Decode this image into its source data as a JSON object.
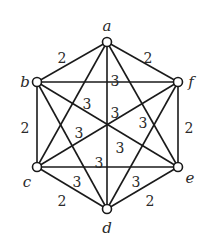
{
  "diagram": {
    "type": "weighted-graph",
    "nodes": [
      {
        "id": "a",
        "label": "a",
        "x": 107,
        "y": 42,
        "lx": 107,
        "ly": 26
      },
      {
        "id": "b",
        "label": "b",
        "x": 37,
        "y": 82,
        "lx": 25,
        "ly": 82
      },
      {
        "id": "f",
        "label": "f",
        "x": 178,
        "y": 82,
        "lx": 191,
        "ly": 82
      },
      {
        "id": "c",
        "label": "c",
        "x": 37,
        "y": 167,
        "lx": 27,
        "ly": 182
      },
      {
        "id": "e",
        "label": "e",
        "x": 178,
        "y": 167,
        "lx": 190,
        "ly": 178
      },
      {
        "id": "d",
        "label": "d",
        "x": 107,
        "y": 209,
        "lx": 107,
        "ly": 228
      }
    ],
    "edges": [
      {
        "from": "a",
        "to": "b",
        "weight": "2",
        "lx": 62,
        "ly": 58
      },
      {
        "from": "a",
        "to": "f",
        "weight": "2",
        "lx": 148,
        "ly": 58
      },
      {
        "from": "b",
        "to": "c",
        "weight": "2",
        "lx": 25,
        "ly": 128
      },
      {
        "from": "f",
        "to": "e",
        "weight": "2",
        "lx": 189,
        "ly": 128
      },
      {
        "from": "c",
        "to": "d",
        "weight": "2",
        "lx": 62,
        "ly": 201
      },
      {
        "from": "e",
        "to": "d",
        "weight": "2",
        "lx": 150,
        "ly": 201
      },
      {
        "from": "a",
        "to": "c",
        "weight": "3",
        "lx": 87,
        "ly": 104
      },
      {
        "from": "a",
        "to": "d",
        "weight": "3",
        "lx": 115,
        "ly": 81
      },
      {
        "from": "a",
        "to": "e",
        "weight": "3",
        "lx": 143,
        "ly": 123
      },
      {
        "from": "b",
        "to": "f",
        "weight": "3",
        "lx": 115,
        "ly": 113
      },
      {
        "from": "b",
        "to": "d",
        "weight": "3",
        "lx": 79,
        "ly": 133
      },
      {
        "from": "b",
        "to": "e",
        "weight": "3",
        "lx": 120,
        "ly": 148
      },
      {
        "from": "f",
        "to": "c",
        "weight": "3",
        "lx": 99,
        "ly": 163
      },
      {
        "from": "f",
        "to": "d",
        "weight": "3",
        "lx": 136,
        "ly": 182
      },
      {
        "from": "c",
        "to": "e",
        "weight": "3",
        "lx": 77,
        "ly": 182
      }
    ]
  }
}
